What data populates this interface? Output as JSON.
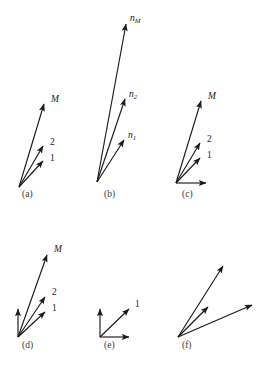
{
  "figure": {
    "width": 271,
    "height": 370,
    "background": "#ffffff",
    "stroke_color": "#1a1a1a",
    "label_color": "#1a1a1a",
    "caption_color": "#3a3a3a"
  },
  "panels": [
    {
      "id": "a",
      "caption": "(a)",
      "caption_x": 22,
      "caption_y": 197,
      "origin": {
        "x": 19,
        "y": 187
      },
      "vectors": [
        {
          "name": "M",
          "label": "M",
          "label_type": "italic",
          "tip_x": 44,
          "tip_y": 104,
          "label_x": 51,
          "label_y": 102
        },
        {
          "name": "2",
          "label": "2",
          "label_type": "number",
          "tip_x": 43,
          "tip_y": 146,
          "label_x": 50,
          "label_y": 145
        },
        {
          "name": "1",
          "label": "1",
          "label_type": "number",
          "tip_x": 43,
          "tip_y": 161,
          "label_x": 50,
          "label_y": 161
        }
      ]
    },
    {
      "id": "b",
      "caption": "(b)",
      "caption_x": 104,
      "caption_y": 197,
      "origin": {
        "x": 97,
        "y": 182
      },
      "vectors": [
        {
          "name": "n-M",
          "label": "n",
          "sublabel": "M",
          "label_type": "italic",
          "tip_x": 126,
          "tip_y": 24,
          "label_x": 130,
          "label_y": 21
        },
        {
          "name": "n-2",
          "label": "n",
          "sublabel": "2",
          "label_type": "italic",
          "tip_x": 125,
          "tip_y": 99,
          "label_x": 129,
          "label_y": 97
        },
        {
          "name": "n-1",
          "label": "n",
          "sublabel": "1",
          "label_type": "italic",
          "tip_x": 124,
          "tip_y": 140,
          "label_x": 128,
          "label_y": 138
        }
      ]
    },
    {
      "id": "c",
      "caption": "(c)",
      "caption_x": 182,
      "caption_y": 197,
      "origin": {
        "x": 176,
        "y": 183
      },
      "vectors": [
        {
          "name": "M",
          "label": "M",
          "label_type": "italic",
          "tip_x": 201,
          "tip_y": 101,
          "label_x": 208,
          "label_y": 99
        },
        {
          "name": "2",
          "label": "2",
          "label_type": "number",
          "tip_x": 200,
          "tip_y": 143,
          "label_x": 207,
          "label_y": 142
        },
        {
          "name": "1",
          "label": "1",
          "label_type": "number",
          "tip_x": 200,
          "tip_y": 158,
          "label_x": 207,
          "label_y": 158
        },
        {
          "name": "axis-horizontal",
          "label": "",
          "label_type": "none",
          "tip_x": 206,
          "tip_y": 183,
          "label_x": 0,
          "label_y": 0
        }
      ]
    },
    {
      "id": "d",
      "caption": "(d)",
      "caption_x": 22,
      "caption_y": 348,
      "origin": {
        "x": 18,
        "y": 337
      },
      "vectors": [
        {
          "name": "M",
          "label": "M",
          "label_type": "italic",
          "tip_x": 47,
          "tip_y": 255,
          "label_x": 54,
          "label_y": 252
        },
        {
          "name": "2",
          "label": "2",
          "label_type": "number",
          "tip_x": 45,
          "tip_y": 297,
          "label_x": 52,
          "label_y": 295
        },
        {
          "name": "1",
          "label": "1",
          "label_type": "number",
          "tip_x": 45,
          "tip_y": 312,
          "label_x": 52,
          "label_y": 311
        },
        {
          "name": "axis-vertical",
          "label": "",
          "label_type": "none",
          "tip_x": 18,
          "tip_y": 309,
          "label_x": 0,
          "label_y": 0
        }
      ]
    },
    {
      "id": "e",
      "caption": "(e)",
      "caption_x": 104,
      "caption_y": 348,
      "origin": {
        "x": 100,
        "y": 337
      },
      "vectors": [
        {
          "name": "1",
          "label": "1",
          "label_type": "number",
          "tip_x": 129,
          "tip_y": 309,
          "label_x": 135,
          "label_y": 307
        },
        {
          "name": "axis-vertical",
          "label": "",
          "label_type": "none",
          "tip_x": 100,
          "tip_y": 309,
          "label_x": 0,
          "label_y": 0
        },
        {
          "name": "axis-horizontal",
          "label": "",
          "label_type": "none",
          "tip_x": 129,
          "tip_y": 337,
          "label_x": 0,
          "label_y": 0
        }
      ]
    },
    {
      "id": "f",
      "caption": "(f)",
      "caption_x": 182,
      "caption_y": 348,
      "origin": {
        "x": 178,
        "y": 337
      },
      "vectors": [
        {
          "name": "upper",
          "label": "",
          "label_type": "none",
          "tip_x": 223,
          "tip_y": 266,
          "label_x": 0,
          "label_y": 0
        },
        {
          "name": "middle",
          "label": "",
          "label_type": "none",
          "tip_x": 208,
          "tip_y": 307,
          "label_x": 0,
          "label_y": 0
        },
        {
          "name": "lower",
          "label": "",
          "label_type": "none",
          "tip_x": 252,
          "tip_y": 305,
          "label_x": 0,
          "label_y": 0
        }
      ]
    }
  ]
}
